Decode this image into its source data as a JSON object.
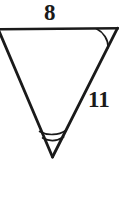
{
  "figure": {
    "kind": "geometry-diagram",
    "background_color": "#ffffff",
    "stroke_color": "#1a1a1a",
    "label_color": "#1a1a1a",
    "stroke_width": 2.6,
    "arc_stroke_width": 1.6,
    "labels": {
      "top_side": "8",
      "right_side": "11"
    },
    "vertices": {
      "top_left": {
        "x": 1,
        "y": 29
      },
      "top_right": {
        "x": 117,
        "y": 28
      },
      "bottom": {
        "x": 52,
        "y": 156
      }
    },
    "sides": [
      {
        "name": "top-side",
        "from": "top_left",
        "to": "top_right",
        "label": "8"
      },
      {
        "name": "right-side",
        "from": "top_right",
        "to": "bottom",
        "label": "11"
      },
      {
        "name": "left-side",
        "from": "top_left",
        "to": "bottom",
        "label": ""
      }
    ],
    "angle_marks": [
      {
        "name": "top-right-angle-arc",
        "vertex": "top_right",
        "arc_count": 1
      },
      {
        "name": "bottom-angle-arc",
        "vertex": "bottom",
        "arc_count": 2
      }
    ]
  }
}
